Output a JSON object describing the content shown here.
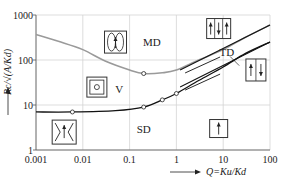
{
  "chart_data": {
    "type": "line",
    "title": "",
    "xlabel": "Q=K_u/K_d",
    "ylabel": "R_c/√(A/K_d)",
    "xscale": "log",
    "yscale": "log",
    "xlim": [
      0.001,
      100
    ],
    "ylim": [
      1,
      1000
    ],
    "grid": true,
    "x_ticks": [
      "0.001",
      "0.01",
      "0.1",
      "1",
      "10",
      "100"
    ],
    "y_ticks": [
      "1",
      "10",
      "100",
      "1000"
    ],
    "series": [
      {
        "name": "MD-V boundary",
        "color": "#9a9a9a",
        "points": [
          [
            0.001,
            370
          ],
          [
            0.003,
            260
          ],
          [
            0.01,
            170
          ],
          [
            0.03,
            95
          ],
          [
            0.1,
            60
          ],
          [
            0.2,
            50
          ],
          [
            0.5,
            52
          ],
          [
            1,
            60
          ],
          [
            3,
            100
          ],
          [
            10,
            170
          ],
          [
            30,
            320
          ],
          [
            100,
            600
          ]
        ],
        "markers": [
          [
            0.2,
            50
          ]
        ]
      },
      {
        "name": "SD-V boundary",
        "color": "#111111",
        "points": [
          [
            0.001,
            7
          ],
          [
            0.006,
            7
          ],
          [
            0.05,
            7.5
          ],
          [
            0.2,
            9
          ],
          [
            0.5,
            13
          ],
          [
            1,
            18
          ],
          [
            3,
            35
          ],
          [
            10,
            70
          ],
          [
            30,
            140
          ],
          [
            100,
            250
          ]
        ],
        "markers": [
          [
            0.006,
            7
          ],
          [
            0.2,
            9
          ],
          [
            0.5,
            13
          ],
          [
            1,
            18
          ]
        ]
      }
    ],
    "asymptotes": [
      {
        "name": "MD asymptote",
        "color": "#111111",
        "points": [
          [
            1.2,
            60
          ],
          [
            100,
            600
          ]
        ]
      },
      {
        "name": "SD asymptote",
        "color": "#111111",
        "points": [
          [
            1.2,
            25
          ],
          [
            100,
            250
          ]
        ]
      }
    ],
    "regions": [
      {
        "label": "MD",
        "x": 0.3,
        "y": 250
      },
      {
        "label": "V",
        "x": 0.06,
        "y": 23
      },
      {
        "label": "SD",
        "x": 0.2,
        "y": 3
      },
      {
        "label": "TD",
        "x": 12,
        "y": 150
      }
    ],
    "icons": [
      {
        "name": "md-domain-icon",
        "x": 0.05,
        "y": 250,
        "desc": "two closed flux loops"
      },
      {
        "name": "vortex-icon",
        "x": 0.02,
        "y": 25,
        "desc": "vortex square"
      },
      {
        "name": "sd-flower-icon",
        "x": 0.004,
        "y": 2.5,
        "desc": "flower state single domain"
      },
      {
        "name": "md-stripe-icon",
        "x": 8,
        "y": 500,
        "desc": "three stripes up-down-up"
      },
      {
        "name": "td-icon",
        "x": 50,
        "y": 60,
        "desc": "two stripes up-down"
      },
      {
        "name": "sd-icon",
        "x": 8,
        "y": 3,
        "desc": "single domain arrow up"
      }
    ]
  }
}
